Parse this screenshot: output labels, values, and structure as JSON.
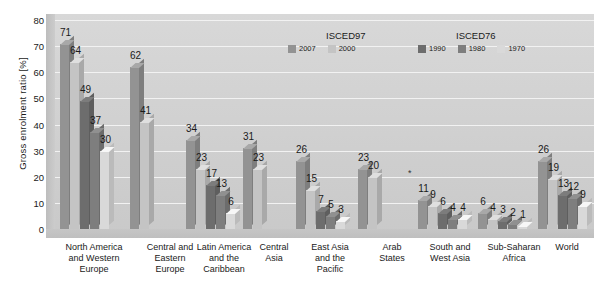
{
  "chart_data": {
    "type": "bar",
    "title": "",
    "subtitle": "",
    "xlabel": "",
    "ylabel": "Gross enrolment ratio [%]",
    "ylim": [
      0,
      80
    ],
    "yticks": [
      0,
      10,
      20,
      30,
      40,
      50,
      60,
      70,
      80
    ],
    "grid": true,
    "legend_position": "top-center",
    "legend_groups": [
      {
        "title": "ISCED97",
        "entries": [
          {
            "name": "2007",
            "color": "#939393"
          },
          {
            "name": "2000",
            "color": "#c4c4c4"
          }
        ]
      },
      {
        "title": "ISCED76",
        "entries": [
          {
            "name": "1990",
            "color": "#6d6d6d"
          },
          {
            "name": "1980",
            "color": "#7e7e7e"
          },
          {
            "name": "1970",
            "color": "#d9d9d9"
          }
        ]
      }
    ],
    "categories": [
      "North America and Western Europe",
      "Central and Eastern Europe",
      "Latin America and the Caribbean",
      "Central Asia",
      "East Asia and the Pacific",
      "Arab States",
      "South and West Asia",
      "Sub-Saharan Africa",
      "World"
    ],
    "category_label_lines": [
      [
        "North America",
        "and Western",
        "Europe"
      ],
      [
        "Central and",
        "Eastern",
        "Europe"
      ],
      [
        "Latin America",
        "and the",
        "Caribbean"
      ],
      [
        "Central",
        "Asia"
      ],
      [
        "East Asia",
        "and the",
        "Pacific"
      ],
      [
        "Arab",
        "States"
      ],
      [
        "South and",
        "West Asia"
      ],
      [
        "Sub-Saharan",
        "Africa"
      ],
      [
        "World"
      ]
    ],
    "series": [
      {
        "name": "2007",
        "color": "#939393",
        "values": [
          71,
          62,
          34,
          31,
          26,
          23,
          11,
          6,
          26
        ]
      },
      {
        "name": "2000",
        "color": "#c4c4c4",
        "values": [
          64,
          41,
          23,
          23,
          15,
          20,
          9,
          4,
          19
        ]
      },
      {
        "name": "1990",
        "color": "#6d6d6d",
        "values": [
          49,
          null,
          17,
          null,
          7,
          null,
          6,
          3,
          13
        ]
      },
      {
        "name": "1980",
        "color": "#7e7e7e",
        "values": [
          37,
          null,
          13,
          null,
          5,
          null,
          4,
          2,
          12
        ]
      },
      {
        "name": "1970",
        "color": "#d9d9d9",
        "values": [
          30,
          null,
          6,
          null,
          3,
          null,
          4,
          1,
          9
        ]
      }
    ],
    "annotations": [
      {
        "text": "*",
        "near": "Arab States / South and West Asia"
      }
    ]
  }
}
